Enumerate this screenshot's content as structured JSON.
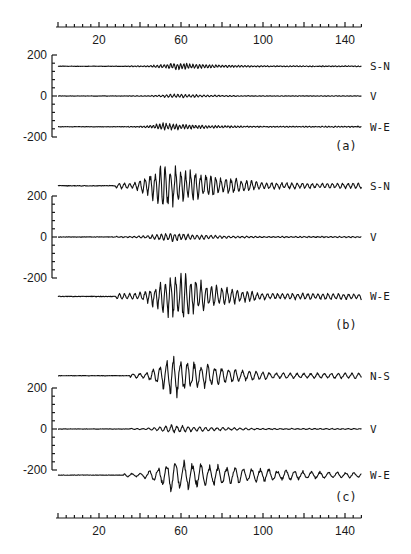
{
  "header": {
    "running_title": "",
    "page_number": ""
  },
  "chart_data": {
    "type": "line",
    "xlabel": "",
    "ylabel": "",
    "x_ticks": [
      20,
      60,
      100,
      140
    ],
    "x_range": [
      0,
      148
    ],
    "y_ticks": [
      200,
      0,
      -200
    ],
    "grid": false,
    "panels": [
      {
        "id": "a",
        "label": "(a)",
        "ylim": [
          -200,
          200
        ],
        "series": [
          {
            "name": "S-N",
            "offset": 145,
            "onset": 34,
            "peak_time": 58,
            "peak_amp": 14,
            "decay": 0.045,
            "period": 1.6,
            "noise": 2
          },
          {
            "name": "V",
            "offset": 0,
            "onset": 34,
            "peak_time": 58,
            "peak_amp": 8,
            "decay": 0.05,
            "period": 1.8,
            "noise": 1.5
          },
          {
            "name": "W-E",
            "offset": -150,
            "onset": 34,
            "peak_time": 52,
            "peak_amp": 15,
            "decay": 0.045,
            "period": 1.6,
            "noise": 2
          }
        ]
      },
      {
        "id": "b",
        "label": "(b)",
        "ylim": [
          -200,
          200
        ],
        "series": [
          {
            "name": "S-N",
            "offset": 250,
            "onset": 28,
            "peak_time": 52,
            "peak_amp": 90,
            "decay": 0.035,
            "period": 2.5,
            "noise": 3
          },
          {
            "name": "V",
            "offset": 0,
            "onset": 28,
            "peak_time": 55,
            "peak_amp": 18,
            "decay": 0.05,
            "period": 2.2,
            "noise": 2
          },
          {
            "name": "W-E",
            "offset": -290,
            "onset": 28,
            "peak_time": 58,
            "peak_amp": 100,
            "decay": 0.045,
            "period": 2.5,
            "noise": 3
          }
        ]
      },
      {
        "id": "c",
        "label": "(c)",
        "ylim": [
          -200,
          200
        ],
        "series": [
          {
            "name": "N-S",
            "offset": 260,
            "onset": 35,
            "peak_time": 56,
            "peak_amp": 85,
            "decay": 0.04,
            "period": 3.4,
            "noise": 2
          },
          {
            "name": "V",
            "offset": 0,
            "onset": 35,
            "peak_time": 55,
            "peak_amp": 16,
            "decay": 0.04,
            "period": 2.8,
            "noise": 1.5
          },
          {
            "name": "W-E",
            "offset": -225,
            "onset": 32,
            "peak_time": 55,
            "peak_amp": 60,
            "decay": 0.02,
            "period": 4.2,
            "noise": 2
          }
        ]
      }
    ]
  },
  "layout": {
    "x_px_per_unit": 2.05,
    "x_origin_px": 58,
    "x_end": 148,
    "top_axis_y": 27,
    "bottom_axis_y": 518,
    "y_axis_x": 52,
    "panel_zero_y": [
      96,
      237,
      429
    ],
    "px_per_200": 41,
    "panel_label_y": [
      150,
      329,
      501
    ]
  },
  "colors": {
    "ink": "#111111",
    "background": "#ffffff"
  }
}
